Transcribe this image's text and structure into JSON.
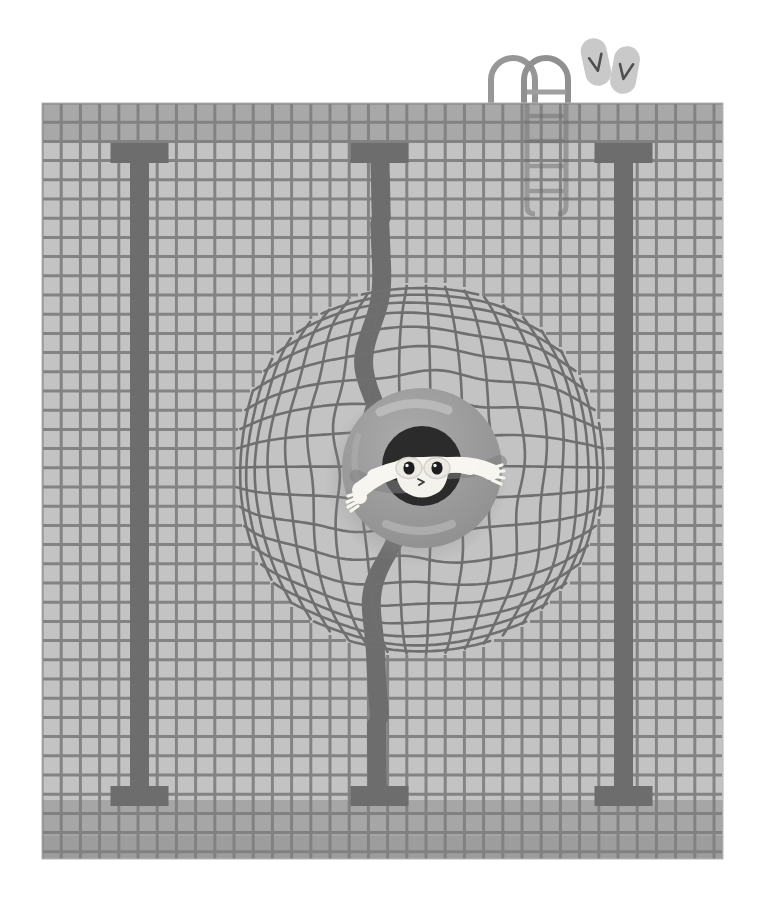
{
  "artwork": {
    "title": "Swimmer in inner tube at pool",
    "canvas": {
      "width": 761,
      "height": 919,
      "background": "#ffffff"
    }
  },
  "palette": {
    "page_background": "#ffffff",
    "tile_light": "#c3c3c3",
    "tile_mid": "#bcbcbc",
    "tile_dark_band": "#a9a9a9",
    "tile_bottom_band": "#a3a3a3",
    "grout": "#7e7e7e",
    "grout_soft": "#8a8a8a",
    "lane_stripe": "#6d6d6d",
    "ripple_line": "#6f6f6f",
    "ring_body": "#9a9a9a",
    "ring_shadow": "#8a8a8a",
    "ring_highlight": "#b8b8b8",
    "skin": "#f4f2ec",
    "hair": "#2b2b2b",
    "goggle_strap": "#f7f6f1",
    "goggle_lens": "#e8e6df",
    "eye": "#1d1d1d",
    "ladder_rail": "#8d8d8d",
    "ladder_rail_submerged": "#7c7c7c",
    "flipflop_body": "#c9c9c9",
    "flipflop_strap": "#5a5a5a",
    "flipflop_shadow": "#d6d6d6"
  },
  "pool": {
    "label": "swimming-pool",
    "bounds": {
      "x": 42,
      "y": 103,
      "width": 681,
      "height": 756
    },
    "tile": {
      "cell": 19.2,
      "grout_width": 3
    },
    "top_band": {
      "rows": 2,
      "label": "deck-edge-tiles"
    },
    "bottom_band": {
      "rows": 3,
      "label": "far-end-tiles"
    },
    "lane_stripes": [
      {
        "name": "lane-stripe-left",
        "x": 130,
        "width": 19,
        "cap_width": 58
      },
      {
        "name": "lane-stripe-center",
        "x": 370,
        "width": 19,
        "cap_width": 58,
        "wavy": true
      },
      {
        "name": "lane-stripe-right",
        "x": 614,
        "width": 19,
        "cap_width": 58
      }
    ],
    "stripe_top": 143,
    "stripe_bottom": 806
  },
  "ripple": {
    "label": "water-ripple-distortion",
    "center": {
      "x": 420,
      "y": 470
    },
    "radius": 185,
    "strength": 0.55
  },
  "swimmer": {
    "label": "swimmer-in-inner-tube",
    "ring": {
      "center": {
        "x": 422,
        "y": 468
      },
      "outer_radius": 80,
      "inner_radius": 40
    },
    "head": {
      "center": {
        "x": 422,
        "y": 466
      },
      "radius": 40
    },
    "goggles": {
      "lens_count": 2
    },
    "arms": {
      "count": 2,
      "span": 170
    },
    "expression": "smiling"
  },
  "ladder": {
    "label": "pool-ladder",
    "rails": 2,
    "rungs": 5,
    "x": 489,
    "top_y": 61,
    "waterline_y": 103
  },
  "flipflops": {
    "label": "pair-of-flip-flops",
    "count": 2,
    "items": [
      {
        "name": "flip-flop-left",
        "x": 596,
        "y": 62,
        "rotate": -12
      },
      {
        "name": "flip-flop-right",
        "x": 625,
        "y": 70,
        "rotate": 10
      }
    ]
  }
}
